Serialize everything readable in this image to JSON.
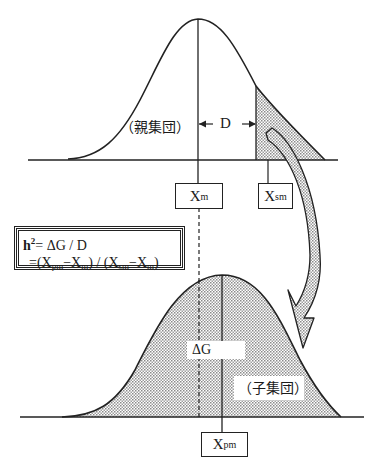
{
  "parent_population": {
    "label": "（親集団）",
    "mean_label_main": "X",
    "mean_label_sub": "m",
    "selected_mean_label_main": "X",
    "selected_mean_label_sub": "sm",
    "selection_differential_label": "D"
  },
  "offspring_population": {
    "label": "（子集団）",
    "mean_label_main": "X",
    "mean_label_sub": "pm",
    "response_label": "ΔG"
  },
  "formula": {
    "line1_h": "h",
    "line1_sup": "2",
    "line1_rest": "= ΔG / D",
    "line2_a": "=(X",
    "line2_a_sub": "pm",
    "line2_b": "−X",
    "line2_b_sub": "m",
    "line2_c": ") / (X",
    "line2_c_sub": "sm",
    "line2_d": "−X",
    "line2_d_sub": "m",
    "line2_e": ")"
  },
  "colors": {
    "line": "#222222",
    "shade": "#b8b8b8",
    "background": "#ffffff"
  }
}
